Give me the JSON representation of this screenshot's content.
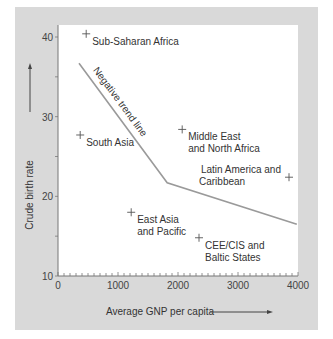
{
  "chart_data": {
    "type": "scatter",
    "title": "",
    "xlabel": "Average GNP per capita",
    "ylabel": "Crude birth rate",
    "xlim": [
      0,
      4000
    ],
    "ylim": [
      10,
      42
    ],
    "x_ticks": [
      0,
      1000,
      2000,
      3000,
      4000
    ],
    "x_tick_labels": [
      "0",
      "1000",
      "2000",
      "3000",
      "4000"
    ],
    "y_ticks": [
      10,
      20,
      30,
      40
    ],
    "y_tick_labels": [
      "10",
      "20",
      "30",
      "40"
    ],
    "x_minor_step": 100,
    "y_minor_step": 5,
    "grid": false,
    "legend": "none",
    "points": [
      {
        "name": "sub-saharan-africa",
        "label": [
          "Sub-Saharan Africa"
        ],
        "x": 470,
        "y": 40.4,
        "label_side": "right-below"
      },
      {
        "name": "south-asia",
        "label": [
          "South Asia"
        ],
        "x": 370,
        "y": 27.7,
        "label_side": "right-below"
      },
      {
        "name": "middle-east-north-africa",
        "label": [
          "Middle East",
          "and North Africa"
        ],
        "x": 2070,
        "y": 28.4,
        "label_side": "right-below"
      },
      {
        "name": "latin-america-caribbean",
        "label": [
          "Latin America and",
          "Caribbean"
        ],
        "x": 3850,
        "y": 22.4,
        "label_side": "left"
      },
      {
        "name": "east-asia-pacific",
        "label": [
          "East Asia",
          "and Pacific"
        ],
        "x": 1220,
        "y": 18.0,
        "label_side": "right-below"
      },
      {
        "name": "cee-cis-baltic",
        "label": [
          "CEE/CIS and",
          "Baltic States"
        ],
        "x": 2350,
        "y": 14.8,
        "label_side": "right-below"
      }
    ],
    "trend_line": {
      "label": "Negative trend line",
      "points": [
        [
          350,
          36.7
        ],
        [
          1820,
          21.7
        ],
        [
          3980,
          16.5
        ]
      ]
    }
  },
  "colors": {
    "panel": "#d9d9d9",
    "plot_bg": "#ffffff",
    "trend": "#9a9a9a",
    "axis": "#777777",
    "text": "#333333"
  }
}
